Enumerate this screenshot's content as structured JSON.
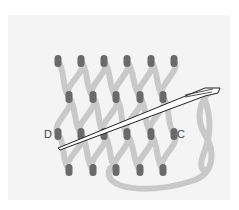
{
  "diagram": {
    "type": "needlework stitch diagram",
    "background_color": "#ffffff",
    "panel_color": "#f3f3f3",
    "thread_color": "#c9c9c9",
    "hole_color": "#6a6a6a",
    "needle_stroke": "#222222",
    "labels": {
      "left": "D",
      "right": "C"
    },
    "hole_rows": [
      {
        "y": 61,
        "xs": [
          58,
          81,
          104,
          127,
          151,
          174
        ]
      },
      {
        "y": 97,
        "xs": [
          69,
          93,
          116,
          140,
          163
        ]
      },
      {
        "y": 134,
        "xs": [
          58,
          81,
          104,
          127,
          151,
          174
        ]
      },
      {
        "y": 170,
        "xs": [
          69,
          93,
          116,
          140,
          163
        ]
      }
    ],
    "needle": {
      "tip": [
        58,
        148
      ],
      "eye": [
        218,
        90
      ]
    }
  }
}
